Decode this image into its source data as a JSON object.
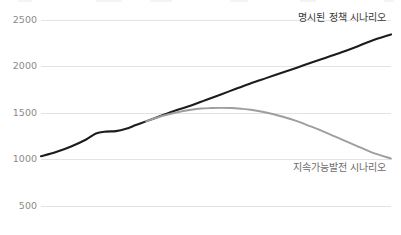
{
  "chart_data": {
    "type": "line",
    "title": "",
    "subtitle": "",
    "xlabel": "",
    "ylabel": "",
    "grid": "horizontal",
    "legend_position": "inline-end-of-line",
    "ylim": [
      250,
      2600
    ],
    "yticks": [
      500,
      1000,
      1500,
      2000,
      2500
    ],
    "ytick_labels": [
      "500",
      "1000",
      "1500",
      "2000",
      "2500"
    ],
    "xlim": [
      0,
      1
    ],
    "xticks": [],
    "xtick_labels": [],
    "series": [
      {
        "name": "명시된 정책 시나리오",
        "color": "#1c1c1c",
        "label_anchor": {
          "x": 0.985,
          "y": 2520
        },
        "x": [
          0.0,
          0.043,
          0.086,
          0.129,
          0.157,
          0.186,
          0.214,
          0.243,
          0.271,
          0.3,
          0.343,
          0.386,
          0.429,
          0.471,
          0.514,
          0.557,
          0.6,
          0.643,
          0.686,
          0.729,
          0.771,
          0.814,
          0.857,
          0.9,
          0.943,
          1.0
        ],
        "values": [
          1035,
          1080,
          1140,
          1215,
          1280,
          1300,
          1305,
          1330,
          1370,
          1410,
          1470,
          1530,
          1580,
          1640,
          1700,
          1760,
          1820,
          1875,
          1930,
          1985,
          2040,
          2095,
          2150,
          2210,
          2275,
          2345
        ]
      },
      {
        "name": "지속가능발전 시나리오",
        "color": "#9e9e9e",
        "label_anchor": {
          "x": 0.985,
          "y": 905
        },
        "x": [
          0.3,
          0.343,
          0.386,
          0.429,
          0.457,
          0.486,
          0.514,
          0.543,
          0.571,
          0.6,
          0.643,
          0.686,
          0.729,
          0.771,
          0.814,
          0.857,
          0.9,
          0.943,
          1.0
        ],
        "values": [
          1410,
          1465,
          1505,
          1535,
          1548,
          1553,
          1555,
          1553,
          1546,
          1535,
          1505,
          1465,
          1415,
          1355,
          1290,
          1220,
          1150,
          1080,
          1010
        ]
      }
    ],
    "annotations": [
      {
        "text": "명시된 정책 시나리오",
        "series": "명시된 정책 시나리오"
      },
      {
        "text": "지속가능발전 시나리오",
        "series": "지속가능발전 시나리오"
      }
    ],
    "colors": {
      "background": "#ffffff",
      "gridline": "#dcdcdc",
      "tick_label": "#8a8a8a",
      "stated_line": "#1c1c1c",
      "sustainable_line": "#9e9e9e",
      "annotation_text": "#3a3a3a"
    }
  }
}
